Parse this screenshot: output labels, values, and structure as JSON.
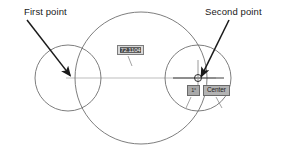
{
  "canvas": {
    "width": 286,
    "height": 152,
    "background": "#ffffff",
    "geometry_color": "#6f6f6f",
    "construction_line_color": "#bdbdbd",
    "annotation_color": "#1a1a1a"
  },
  "annotations": [
    {
      "id": "first-point",
      "label": "First point",
      "label_x": 24,
      "label_y": 6,
      "arrow": {
        "x1": 27,
        "y1": 20,
        "x2": 72,
        "y2": 78
      }
    },
    {
      "id": "second-point",
      "label": "Second point",
      "label_x": 205,
      "label_y": 6,
      "arrow": {
        "x1": 229,
        "y1": 20,
        "x2": 200,
        "y2": 79
      }
    }
  ],
  "circles": [
    {
      "id": "left-circle",
      "cx": 68,
      "cy": 78,
      "r": 33
    },
    {
      "id": "large-circle",
      "cx": 141,
      "cy": 78,
      "r": 66
    },
    {
      "id": "right-circle",
      "cx": 198,
      "cy": 78,
      "r": 33
    }
  ],
  "construction_line": {
    "x1": 66,
    "y1": 78,
    "x2": 216,
    "y2": 78
  },
  "crosshair": {
    "cx": 198,
    "cy": 78,
    "h_x1": 173,
    "h_x2": 224,
    "v_y1": 60,
    "v_y2": 96,
    "marker_r": 3.5
  },
  "dimension_input": {
    "value": "72.1104",
    "x": 117,
    "y": 45,
    "width": 27,
    "height": 10,
    "state": "selected",
    "fill": "#d8d8d8",
    "highlight": "#4a4a4a"
  },
  "angle_input": {
    "value": "1°",
    "x": 187,
    "y": 85,
    "width": 13,
    "height": 11,
    "fill": "#a9a9a9"
  },
  "osnap_tooltip": {
    "label": "Center",
    "x": 203,
    "y": 85,
    "fill": "#b3b3b3"
  },
  "leader_ticks": [
    {
      "id": "tick-dim",
      "x1": 128,
      "y1": 56,
      "x2": 132,
      "y2": 66
    },
    {
      "id": "tick-angle",
      "x1": 191,
      "y1": 97,
      "x2": 186,
      "y2": 108
    },
    {
      "id": "tick-osnap",
      "x1": 216,
      "y1": 97,
      "x2": 222,
      "y2": 108
    }
  ]
}
